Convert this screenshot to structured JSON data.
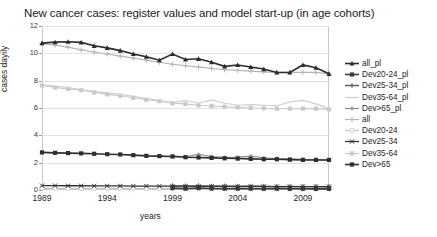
{
  "chart": {
    "title": "New cancer cases: register values and model start-up (in age cohorts)",
    "xlabel": "years",
    "ylabel": "cases dayily"
  },
  "axes": {
    "yticks": [
      "12",
      "10",
      "8",
      "6",
      "4",
      "2",
      "0"
    ],
    "xticks": [
      "1989",
      "1994",
      "1999",
      "2004",
      "2009"
    ]
  },
  "legend": {
    "items": [
      {
        "label": "all_pl",
        "color": "#2b2b2b",
        "marker": "triangle",
        "width": 1.6
      },
      {
        "label": "Dev20-24_pl",
        "color": "#3a3a3a",
        "marker": "square",
        "width": 1.6
      },
      {
        "label": "Dev25-34_pl",
        "color": "#555555",
        "marker": "plus",
        "width": 1.4
      },
      {
        "label": "Dev35-64_pl",
        "color": "#cfcfcf",
        "marker": "none",
        "width": 1.2
      },
      {
        "label": "Dev>65_pl",
        "color": "#8f8f8f",
        "marker": "star",
        "width": 1.2
      },
      {
        "label": "all",
        "color": "#b5b5b5",
        "marker": "plus",
        "width": 1.2
      },
      {
        "label": "Dev20-24",
        "color": "#c4c4c4",
        "marker": "circle",
        "width": 1.2
      },
      {
        "label": "Dev25-34",
        "color": "#333333",
        "marker": "cross",
        "width": 1.3
      },
      {
        "label": "Dev35-64",
        "color": "#c9c9c9",
        "marker": "square",
        "width": 1.1
      },
      {
        "label": "Dev>65",
        "color": "#2e2e2e",
        "marker": "square",
        "width": 1.6
      }
    ]
  },
  "chart_data": {
    "type": "line",
    "title": "New cancer cases: register values and model start-up (in age cohorts)",
    "xlabel": "years",
    "ylabel": "cases dayily",
    "xlim": [
      1989,
      2011
    ],
    "ylim": [
      0,
      12
    ],
    "ytick_values": [
      0,
      2,
      4,
      6,
      8,
      10,
      12
    ],
    "xtick_values": [
      1989,
      1994,
      1999,
      2004,
      2009
    ],
    "grid": true,
    "legend_position": "right",
    "x": [
      1989,
      1990,
      1991,
      1992,
      1993,
      1994,
      1995,
      1996,
      1997,
      1998,
      1999,
      2000,
      2001,
      2002,
      2003,
      2004,
      2005,
      2006,
      2007,
      2008,
      2009,
      2010,
      2011
    ],
    "series": [
      {
        "name": "all_pl",
        "color": "#2b2b2b",
        "x": [
          1989,
          1990,
          1991,
          1992,
          1993,
          1994,
          1995,
          1996,
          1997,
          1998,
          1999,
          2000,
          2001,
          2002,
          2003,
          2004,
          2005,
          2006,
          2007,
          2008,
          2009,
          2010,
          2011
        ],
        "values": [
          10.75,
          10.82,
          10.85,
          10.8,
          10.55,
          10.4,
          10.2,
          9.95,
          9.75,
          9.5,
          9.95,
          9.55,
          9.6,
          9.35,
          9.05,
          9.15,
          9.0,
          8.85,
          8.6,
          8.6,
          9.15,
          8.95,
          8.5
        ]
      },
      {
        "name": "all",
        "color": "#b5b5b5",
        "x": [
          1989,
          1990,
          1991,
          1992,
          1993,
          1994,
          1995,
          1996,
          1997,
          1998,
          1999,
          2000,
          2001,
          2002,
          2003,
          2004,
          2005,
          2006,
          2007,
          2008,
          2009,
          2010,
          2011
        ],
        "values": [
          10.7,
          10.6,
          10.45,
          10.25,
          10.1,
          9.95,
          9.8,
          9.65,
          9.5,
          9.35,
          9.2,
          9.1,
          9.0,
          8.9,
          8.8,
          8.75,
          8.7,
          8.65,
          8.6,
          8.6,
          8.6,
          8.6,
          8.5
        ]
      },
      {
        "name": "Dev35-64_pl",
        "color": "#cfcfcf",
        "x": [
          1989,
          1990,
          1991,
          1992,
          1993,
          1994,
          1995,
          1996,
          1997,
          1998,
          1999,
          2000,
          2001,
          2002,
          2003,
          2004,
          2005,
          2006,
          2007,
          2008,
          2009,
          2010,
          2011
        ],
        "values": [
          7.7,
          7.6,
          7.5,
          7.35,
          7.2,
          7.1,
          7.0,
          6.85,
          6.7,
          6.55,
          6.4,
          6.55,
          6.35,
          6.6,
          6.35,
          6.2,
          6.25,
          6.2,
          6.15,
          6.45,
          6.55,
          6.3,
          5.95
        ]
      },
      {
        "name": "Dev35-64",
        "color": "#c9c9c9",
        "x": [
          1989,
          1990,
          1991,
          1992,
          1993,
          1994,
          1995,
          1996,
          1997,
          1998,
          1999,
          2000,
          2001,
          2002,
          2003,
          2004,
          2005,
          2006,
          2007,
          2008,
          2009,
          2010,
          2011
        ],
        "values": [
          7.65,
          7.5,
          7.4,
          7.3,
          7.15,
          7.0,
          6.9,
          6.75,
          6.6,
          6.5,
          6.35,
          6.3,
          6.2,
          6.15,
          6.1,
          6.05,
          6.0,
          5.98,
          5.95,
          5.95,
          5.95,
          5.95,
          5.9
        ]
      },
      {
        "name": "Dev>65",
        "color": "#2e2e2e",
        "x": [
          1989,
          1990,
          1991,
          1992,
          1993,
          1994,
          1995,
          1996,
          1997,
          1998,
          1999,
          2000,
          2001,
          2002,
          2003,
          2004,
          2005,
          2006,
          2007,
          2008,
          2009,
          2010,
          2011
        ],
        "values": [
          2.75,
          2.72,
          2.7,
          2.68,
          2.65,
          2.62,
          2.6,
          2.55,
          2.5,
          2.48,
          2.45,
          2.4,
          2.38,
          2.35,
          2.32,
          2.3,
          2.28,
          2.25,
          2.25,
          2.22,
          2.2,
          2.2,
          2.2
        ]
      },
      {
        "name": "Dev>65_pl",
        "color": "#8f8f8f",
        "x": [
          1999,
          2000,
          2001,
          2002,
          2003,
          2004,
          2005,
          2006,
          2007,
          2008,
          2009,
          2010,
          2011
        ],
        "values": [
          2.5,
          2.42,
          2.6,
          2.45,
          2.38,
          2.4,
          2.48,
          2.35,
          2.3,
          2.28,
          2.25,
          2.22,
          2.2
        ]
      },
      {
        "name": "Dev25-34",
        "color": "#333333",
        "x": [
          1989,
          1990,
          1991,
          1992,
          1993,
          1994,
          1995,
          1996,
          1997,
          1998,
          1999,
          2000,
          2001,
          2002,
          2003,
          2004,
          2005,
          2006,
          2007,
          2008,
          2009,
          2010,
          2011
        ],
        "values": [
          0.32,
          0.32,
          0.31,
          0.31,
          0.3,
          0.3,
          0.3,
          0.29,
          0.29,
          0.28,
          0.28,
          0.28,
          0.27,
          0.27,
          0.27,
          0.26,
          0.26,
          0.26,
          0.25,
          0.25,
          0.25,
          0.25,
          0.25
        ]
      },
      {
        "name": "Dev25-34_pl",
        "color": "#555555",
        "x": [
          1999,
          2000,
          2001,
          2002,
          2003,
          2004,
          2005,
          2006,
          2007,
          2008,
          2009,
          2010,
          2011
        ],
        "values": [
          0.3,
          0.28,
          0.3,
          0.27,
          0.28,
          0.26,
          0.27,
          0.26,
          0.25,
          0.26,
          0.25,
          0.25,
          0.24
        ]
      },
      {
        "name": "Dev20-24",
        "color": "#c4c4c4",
        "x": [
          1989,
          1990,
          1991,
          1992,
          1993,
          1994,
          1995,
          1996,
          1997,
          1998,
          1999,
          2000,
          2001,
          2002,
          2003,
          2004,
          2005,
          2006,
          2007,
          2008,
          2009,
          2010,
          2011
        ],
        "values": [
          0.12,
          0.12,
          0.12,
          0.11,
          0.11,
          0.11,
          0.11,
          0.1,
          0.1,
          0.1,
          0.1,
          0.1,
          0.1,
          0.09,
          0.09,
          0.09,
          0.09,
          0.09,
          0.08,
          0.08,
          0.08,
          0.08,
          0.08
        ]
      },
      {
        "name": "Dev20-24_pl",
        "color": "#3a3a3a",
        "x": [
          1999,
          2000,
          2001,
          2002,
          2003,
          2004,
          2005,
          2006,
          2007,
          2008,
          2009,
          2010,
          2011
        ],
        "values": [
          0.14,
          0.1,
          0.15,
          0.11,
          0.1,
          0.1,
          0.1,
          0.09,
          0.1,
          0.09,
          0.09,
          0.08,
          0.08
        ]
      }
    ]
  }
}
